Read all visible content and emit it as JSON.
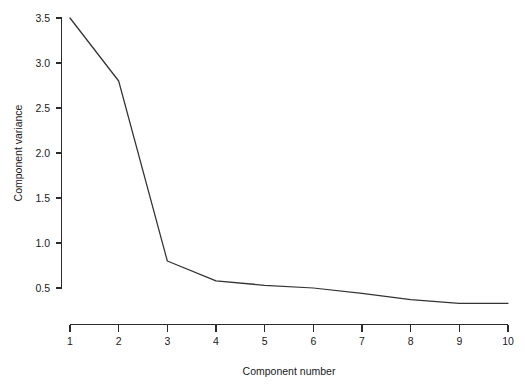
{
  "chart_data": {
    "type": "line",
    "title": "",
    "subtitle": "",
    "xlabel": "Component number",
    "ylabel": "Component variance",
    "x": [
      1,
      2,
      3,
      4,
      5,
      6,
      7,
      8,
      9,
      10
    ],
    "categories": [
      "1",
      "2",
      "3",
      "4",
      "5",
      "6",
      "7",
      "8",
      "9",
      "10"
    ],
    "values": [
      3.5,
      2.8,
      0.8,
      0.58,
      0.53,
      0.5,
      0.44,
      0.37,
      0.33,
      0.33
    ],
    "series": [
      {
        "name": "Component variance",
        "values": [
          3.5,
          2.8,
          0.8,
          0.58,
          0.53,
          0.5,
          0.44,
          0.37,
          0.33,
          0.33
        ]
      }
    ],
    "xlim": [
      1,
      10
    ],
    "ylim": [
      0.28,
      3.5
    ],
    "xticks": [
      1,
      2,
      3,
      4,
      5,
      6,
      7,
      8,
      9,
      10
    ],
    "xtick_labels": [
      "1",
      "2",
      "3",
      "4",
      "5",
      "6",
      "7",
      "8",
      "9",
      "10"
    ],
    "yticks": [
      0.5,
      1.0,
      1.5,
      2.0,
      2.5,
      3.0,
      3.5
    ],
    "ytick_labels": [
      "0.5",
      "1.0",
      "1.5",
      "2.0",
      "2.5",
      "3.0",
      "3.5"
    ],
    "grid": false,
    "legend": false,
    "legend_position": "none",
    "line_color": "#333333",
    "axis_color": "#2b2b2b",
    "background_color": "#ffffff",
    "markers": false,
    "annotations": []
  }
}
